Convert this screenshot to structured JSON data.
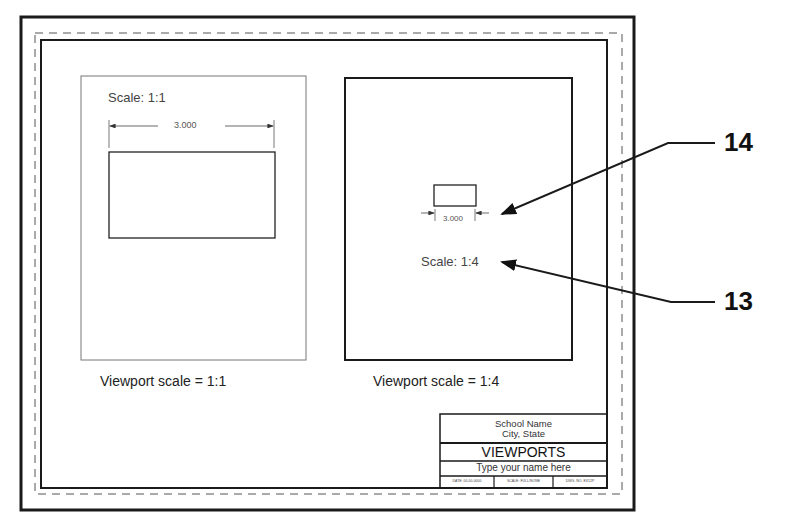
{
  "drawing": {
    "title_block": {
      "school_name": "School Name",
      "city_state": "City, State",
      "title": "VIEWPORTS",
      "name_field": "Type your name here",
      "date": "DATE: 00-00-0000",
      "scale": "SCALE: FULL/NONE",
      "drawing_no": "DWG. NO. EX12P"
    },
    "viewports": [
      {
        "scale_label": "Scale: 1:1",
        "dimension": "3.000",
        "caption": "Viewport scale = 1:1"
      },
      {
        "scale_label": "Scale: 1:4",
        "dimension": "3.000",
        "caption": "Viewport scale = 1:4"
      }
    ],
    "callouts": [
      {
        "number": "14",
        "target": "dimension"
      },
      {
        "number": "13",
        "target": "scale-label"
      }
    ],
    "colors": {
      "line": "#1a1a1a",
      "thin_line": "#777777",
      "background": "#ffffff"
    }
  }
}
